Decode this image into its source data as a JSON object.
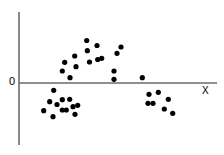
{
  "chart_data": {
    "type": "scatter",
    "title": "",
    "subtitle": "",
    "xlabel": "X",
    "ylabel": "",
    "origin_label": "0",
    "grid": false,
    "legend": null,
    "axes": {
      "x_axis_visible": true,
      "y_axis_visible": true,
      "x_axis_range_px": [
        19,
        217
      ],
      "y_axis_range_px": [
        12,
        145
      ],
      "origin_px": [
        19,
        83
      ],
      "x_tick_labels": [],
      "y_tick_labels": [
        "0"
      ]
    },
    "point_count": 35,
    "points": [
      {
        "x": 53.7,
        "y": 90.3
      },
      {
        "x": 49.7,
        "y": 101.7
      },
      {
        "x": 62.3,
        "y": 99.7
      },
      {
        "x": 69.7,
        "y": 99.3
      },
      {
        "x": 73.0,
        "y": 106.7
      },
      {
        "x": 77.7,
        "y": 105.3
      },
      {
        "x": 43.7,
        "y": 110.7
      },
      {
        "x": 62.3,
        "y": 110.0
      },
      {
        "x": 66.3,
        "y": 110.0
      },
      {
        "x": 75.0,
        "y": 114.3
      },
      {
        "x": 53.0,
        "y": 116.7
      },
      {
        "x": 64.7,
        "y": 62.3
      },
      {
        "x": 62.3,
        "y": 71.0
      },
      {
        "x": 74.7,
        "y": 56.0
      },
      {
        "x": 76.0,
        "y": 66.7
      },
      {
        "x": 87.3,
        "y": 50.7
      },
      {
        "x": 86.7,
        "y": 40.5
      },
      {
        "x": 97.7,
        "y": 59.5
      },
      {
        "x": 101.7,
        "y": 58.3
      },
      {
        "x": 97.0,
        "y": 45.5
      },
      {
        "x": 117.0,
        "y": 53.3
      },
      {
        "x": 114.0,
        "y": 71.0
      },
      {
        "x": 114.0,
        "y": 79.3
      },
      {
        "x": 142.3,
        "y": 77.7
      },
      {
        "x": 70.0,
        "y": 77.7
      },
      {
        "x": 149.0,
        "y": 94.3
      },
      {
        "x": 158.3,
        "y": 92.3
      },
      {
        "x": 168.3,
        "y": 99.3
      },
      {
        "x": 148.0,
        "y": 103.3
      },
      {
        "x": 153.0,
        "y": 103.3
      },
      {
        "x": 164.3,
        "y": 109.0
      },
      {
        "x": 172.7,
        "y": 113.3
      },
      {
        "x": 89.5,
        "y": 62.0
      },
      {
        "x": 57.0,
        "y": 104.5
      },
      {
        "x": 121.0,
        "y": 47.0
      }
    ],
    "colors": {
      "point": "#000000",
      "axis": "#6b6b6b",
      "background": "#ffffff",
      "text": "#000000"
    },
    "point_radius_px": 2.6
  }
}
